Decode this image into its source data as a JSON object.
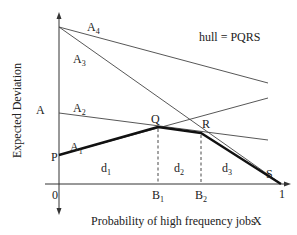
{
  "figure": {
    "y_axis_label": "Expected Deviation",
    "x_axis_label": "Probability of high frequency jobs",
    "x_axis_var": "X",
    "hull_note": "hull = PQRS",
    "origin_label": "0",
    "x_end_label": "1",
    "y_mark_label": "A"
  },
  "lines": [
    {
      "name": "A",
      "sub": "1"
    },
    {
      "name": "A",
      "sub": "2"
    },
    {
      "name": "A",
      "sub": "3"
    },
    {
      "name": "A",
      "sub": "4"
    }
  ],
  "points": {
    "P": "P",
    "Q": "Q",
    "R": "R",
    "S": "S"
  },
  "ticks": [
    {
      "name": "B",
      "sub": "1"
    },
    {
      "name": "B",
      "sub": "2"
    }
  ],
  "regions": [
    {
      "name": "d",
      "sub": "1"
    },
    {
      "name": "d",
      "sub": "2"
    },
    {
      "name": "d",
      "sub": "3"
    }
  ]
}
